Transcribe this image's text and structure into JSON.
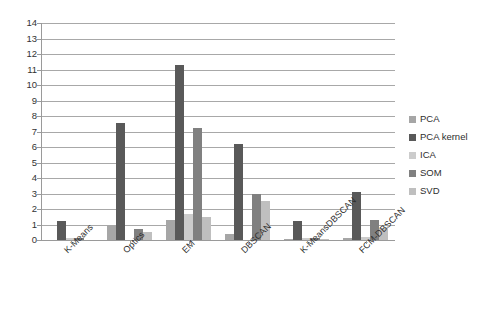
{
  "chart_data": {
    "type": "bar",
    "title": "",
    "subtitle": "",
    "xlabel": "",
    "ylabel": "",
    "ylim": [
      0,
      14
    ],
    "ytick_step": 1,
    "yticks": [
      14,
      13,
      12,
      11,
      10,
      9,
      8,
      7,
      6,
      5,
      4,
      3,
      2,
      1,
      0
    ],
    "grid": true,
    "grid_axis": "y",
    "legend_position": "right",
    "categories": [
      "K-Means",
      "Optics",
      "EM",
      "DBSCAN",
      "K-MeansDBSCAN",
      "FCM-DBSCAN"
    ],
    "series": [
      {
        "name": "PCA",
        "color": "#a6a6a6",
        "values": [
          0.0,
          1.0,
          1.3,
          0.4,
          0.05,
          0.15
        ]
      },
      {
        "name": "PCA kernel",
        "color": "#595959",
        "values": [
          1.2,
          7.55,
          11.3,
          6.2,
          1.2,
          3.1
        ]
      },
      {
        "name": "ICA",
        "color": "#cccccc",
        "values": [
          0.12,
          0.0,
          1.7,
          0.0,
          0.1,
          0.2
        ]
      },
      {
        "name": "SOM",
        "color": "#808080",
        "values": [
          0.1,
          0.7,
          7.2,
          3.0,
          0.1,
          1.3
        ]
      },
      {
        "name": "SVD",
        "color": "#bfbfbf",
        "values": [
          0.0,
          0.5,
          1.5,
          2.5,
          0.05,
          0.8
        ]
      }
    ]
  },
  "legend": {
    "items": [
      {
        "label": "PCA"
      },
      {
        "label": "PCA kernel"
      },
      {
        "label": "ICA"
      },
      {
        "label": "SOM"
      },
      {
        "label": "SVD"
      }
    ]
  }
}
